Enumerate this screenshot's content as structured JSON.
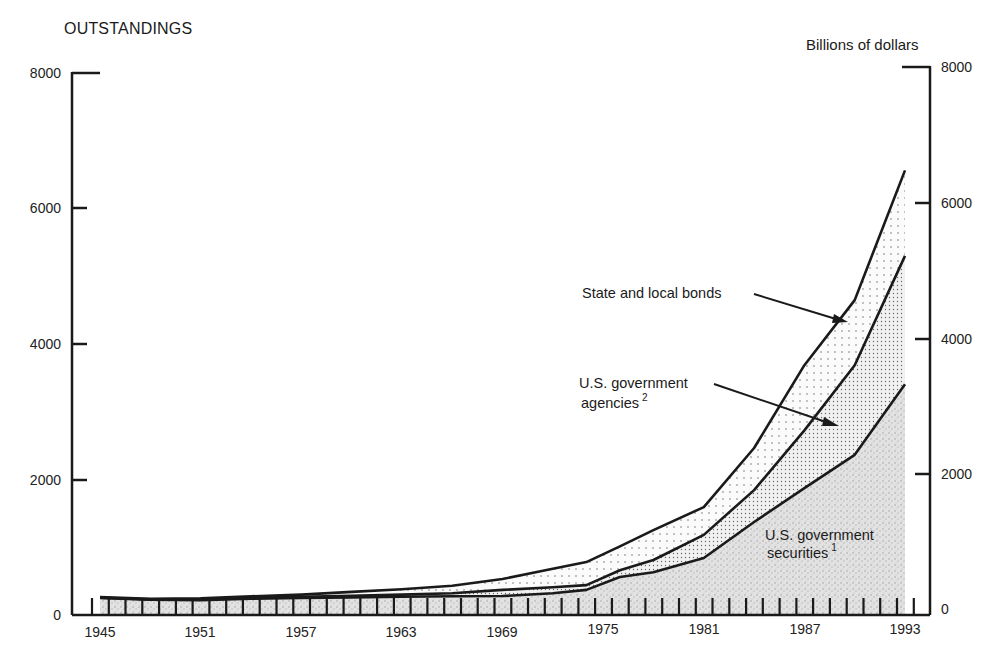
{
  "header": {
    "left_title": "OUTSTANDINGS",
    "right_title": "Billions of dollars"
  },
  "axes": {
    "y_left_ticks": [
      "0",
      "2000",
      "4000",
      "6000",
      "8000"
    ],
    "y_right_ticks": [
      "0",
      "2000",
      "4000",
      "6000",
      "8000"
    ],
    "x_ticks": [
      "1945",
      "1951",
      "1957",
      "1963",
      "1969",
      "1975",
      "1981",
      "1987",
      "1993"
    ]
  },
  "annotations": {
    "state_local": "State and local bonds",
    "agencies_line1": "U.S. government",
    "agencies_line2": "agencies",
    "agencies_sup": "2",
    "securities_line1": "U.S. government",
    "securities_line2": "securities",
    "securities_sup": "1"
  },
  "colors": {
    "line": "#1a1a1a",
    "fill_state_local": "#f4f4f4",
    "fill_agencies": "#e6e6e6",
    "fill_securities": "#d6d6d6"
  },
  "chart_data": {
    "type": "area",
    "title": "OUTSTANDINGS",
    "xlabel": "",
    "ylabel": "Billions of dollars",
    "ylim": [
      0,
      8000
    ],
    "xlim": [
      1945,
      1993
    ],
    "stacked": true,
    "grid": false,
    "legend": "inline annotations with arrows",
    "x": [
      1945,
      1948,
      1951,
      1954,
      1957,
      1960,
      1963,
      1966,
      1969,
      1972,
      1974,
      1976,
      1978,
      1981,
      1984,
      1987,
      1990,
      1993
    ],
    "series": [
      {
        "name": "U.S. government securities",
        "footnote": "1",
        "cumulative_values": [
          250,
          225,
          220,
          240,
          250,
          260,
          270,
          275,
          280,
          320,
          370,
          560,
          630,
          840,
          1370,
          1870,
          2360,
          3400
        ]
      },
      {
        "name": "U.S. government agencies",
        "footnote": "2",
        "cumulative_values": [
          255,
          230,
          230,
          250,
          270,
          285,
          300,
          320,
          370,
          410,
          440,
          660,
          810,
          1180,
          1840,
          2720,
          3680,
          5290
        ]
      },
      {
        "name": "State and local bonds",
        "cumulative_values": [
          265,
          240,
          245,
          275,
          300,
          340,
          380,
          430,
          530,
          680,
          780,
          1010,
          1250,
          1590,
          2460,
          3680,
          4640,
          6550
        ]
      }
    ]
  }
}
